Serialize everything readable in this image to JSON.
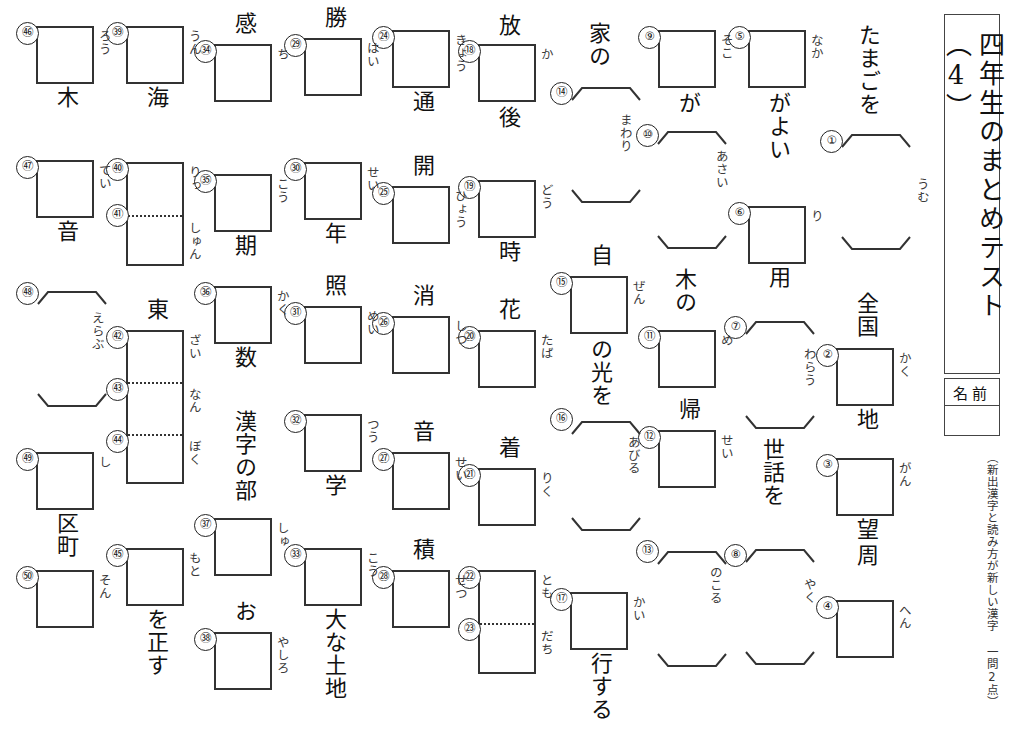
{
  "sheet": {
    "title": "四年生のまとめテスト（4）",
    "name_label": "名前",
    "note": "（新出漢字と読み方が新しい漢字 一問2点）"
  },
  "problems": [
    {
      "no": "①",
      "kind": "bracket",
      "lead": "たまごを",
      "trail": "",
      "reading": "うむ",
      "x": 838,
      "y": 20,
      "lead_x": 856,
      "lead_y": 24,
      "br_x": 840,
      "br_y": 133,
      "br_w": 72,
      "br_h": 118,
      "r_x": 915,
      "r_y": 178,
      "n_x": 820,
      "n_y": 130
    },
    {
      "no": "②",
      "kind": "box",
      "lead": "全国",
      "trail": "地",
      "reading": "かく",
      "x": 836,
      "y": 348,
      "w": 58,
      "h": 58,
      "lead_x": 854,
      "lead_y": 292,
      "trail_x": 854,
      "trail_y": 408,
      "r_x": 897,
      "r_y": 352,
      "n_x": 816,
      "n_y": 344
    },
    {
      "no": "③",
      "kind": "box",
      "lead": "",
      "trail": "望",
      "reading": "がん",
      "x": 836,
      "y": 458,
      "w": 58,
      "h": 58,
      "trail_x": 854,
      "trail_y": 518,
      "r_x": 897,
      "r_y": 462,
      "n_x": 816,
      "n_y": 454
    },
    {
      "no": "④",
      "kind": "box",
      "lead": "周",
      "trail": "",
      "reading": "へん",
      "x": 836,
      "y": 600,
      "w": 58,
      "h": 58,
      "lead_x": 854,
      "lead_y": 544,
      "r_x": 897,
      "r_y": 604,
      "n_x": 816,
      "n_y": 596
    },
    {
      "no": "⑤",
      "kind": "box",
      "lead": "",
      "trail": "がよい",
      "reading": "なか",
      "x": 748,
      "y": 30,
      "w": 58,
      "h": 58,
      "trail_x": 766,
      "trail_y": 92,
      "r_x": 809,
      "r_y": 34,
      "n_x": 728,
      "n_y": 26
    },
    {
      "no": "⑥",
      "kind": "box",
      "lead": "",
      "trail": "用",
      "reading": "り",
      "x": 748,
      "y": 206,
      "w": 58,
      "h": 58,
      "trail_x": 766,
      "trail_y": 266,
      "r_x": 809,
      "r_y": 210,
      "n_x": 728,
      "n_y": 202
    },
    {
      "no": "⑦",
      "kind": "bracket",
      "lead": "",
      "trail": "世話を",
      "reading": "わらう",
      "br_x": 744,
      "br_y": 320,
      "br_w": 72,
      "br_h": 110,
      "trail_x": 760,
      "trail_y": 438,
      "r_x": 802,
      "r_y": 348,
      "n_x": 724,
      "n_y": 316
    },
    {
      "no": "⑧",
      "kind": "bracket",
      "lead": "",
      "trail": "",
      "reading": "やく",
      "br_x": 744,
      "br_y": 548,
      "br_w": 72,
      "br_h": 118,
      "r_x": 802,
      "r_y": 578,
      "n_x": 724,
      "n_y": 544
    },
    {
      "no": "⑨",
      "kind": "box",
      "lead": "",
      "trail": "が",
      "reading": "そこ",
      "x": 658,
      "y": 30,
      "w": 58,
      "h": 58,
      "trail_x": 676,
      "trail_y": 92,
      "r_x": 719,
      "r_y": 34,
      "n_x": 638,
      "n_y": 26
    },
    {
      "no": "⑩",
      "kind": "bracket",
      "lead": "",
      "trail": "木の",
      "reading": "あさい",
      "br_x": 656,
      "br_y": 130,
      "br_w": 72,
      "br_h": 120,
      "trail_x": 672,
      "trail_y": 268,
      "r_x": 714,
      "r_y": 150,
      "n_x": 636,
      "n_y": 124
    },
    {
      "no": "⑪",
      "kind": "box",
      "lead": "",
      "trail": "",
      "reading": "め",
      "x": 658,
      "y": 330,
      "w": 58,
      "h": 58,
      "r_x": 719,
      "r_y": 334,
      "n_x": 638,
      "n_y": 326
    },
    {
      "no": "⑫",
      "kind": "box",
      "lead": "帰",
      "trail": "",
      "reading": "せい",
      "x": 658,
      "y": 430,
      "w": 58,
      "h": 58,
      "lead_x": 676,
      "lead_y": 398,
      "r_x": 719,
      "r_y": 434,
      "n_x": 638,
      "n_y": 426
    },
    {
      "no": "⑬",
      "kind": "bracket",
      "lead": "",
      "trail": "",
      "reading": "のこる",
      "br_x": 656,
      "br_y": 550,
      "br_w": 72,
      "br_h": 118,
      "r_x": 708,
      "r_y": 566,
      "n_x": 636,
      "n_y": 540
    },
    {
      "no": "⑭",
      "kind": "bracket",
      "lead": "家の",
      "trail": "",
      "reading": "まわり",
      "br_x": 570,
      "br_y": 86,
      "br_w": 72,
      "br_h": 118,
      "lead_x": 586,
      "lead_y": 22,
      "r_x": 618,
      "r_y": 114,
      "n_x": 550,
      "n_y": 82
    },
    {
      "no": "⑮",
      "kind": "box",
      "lead": "自",
      "trail": "の光を",
      "reading": "ぜん",
      "x": 570,
      "y": 276,
      "w": 58,
      "h": 58,
      "lead_x": 588,
      "lead_y": 244,
      "trail_x": 588,
      "trail_y": 338,
      "r_x": 631,
      "r_y": 280,
      "n_x": 550,
      "n_y": 272
    },
    {
      "no": "⑯",
      "kind": "bracket",
      "lead": "",
      "trail": "",
      "reading": "あびる",
      "br_x": 570,
      "br_y": 420,
      "br_w": 72,
      "br_h": 112,
      "r_x": 626,
      "r_y": 436,
      "n_x": 550,
      "n_y": 408
    },
    {
      "no": "⑰",
      "kind": "box",
      "lead": "",
      "trail": "行する",
      "reading": "かい",
      "x": 570,
      "y": 592,
      "w": 58,
      "h": 58,
      "trail_x": 588,
      "trail_y": 652,
      "r_x": 631,
      "r_y": 596,
      "n_x": 550,
      "n_y": 588
    },
    {
      "no": "⑱",
      "kind": "box",
      "lead": "放",
      "trail": "後",
      "reading": "か",
      "x": 478,
      "y": 44,
      "w": 58,
      "h": 58,
      "lead_x": 496,
      "lead_y": 14,
      "trail_x": 496,
      "trail_y": 106,
      "r_x": 539,
      "r_y": 48,
      "n_x": 458,
      "n_y": 40
    },
    {
      "no": "⑲",
      "kind": "box",
      "lead": "",
      "trail": "時",
      "reading": "どう",
      "x": 478,
      "y": 180,
      "w": 58,
      "h": 58,
      "trail_x": 496,
      "trail_y": 240,
      "r_x": 539,
      "r_y": 184,
      "n_x": 458,
      "n_y": 176
    },
    {
      "no": "⑳",
      "kind": "box",
      "lead": "花",
      "trail": "",
      "reading": "たば",
      "x": 478,
      "y": 330,
      "w": 58,
      "h": 58,
      "lead_x": 496,
      "lead_y": 298,
      "r_x": 539,
      "r_y": 334,
      "n_x": 458,
      "n_y": 326
    },
    {
      "no": "㉑",
      "kind": "box",
      "lead": "着",
      "trail": "",
      "reading": "りく",
      "x": 478,
      "y": 468,
      "w": 58,
      "h": 58,
      "lead_x": 496,
      "lead_y": 436,
      "r_x": 539,
      "r_y": 472,
      "n_x": 458,
      "n_y": 464
    },
    {
      "no": "㉒",
      "kind": "box2",
      "lead": "",
      "trail": "",
      "reading": "とも",
      "reading2": "だち",
      "x": 478,
      "y": 570,
      "w": 58,
      "h": 104,
      "r_x": 539,
      "r_y": 574,
      "r2_x": 539,
      "r2_y": 630,
      "n_x": 458,
      "n_y": 566,
      "n2": "㉓",
      "n2_x": 458,
      "n2_y": 618
    },
    {
      "no": "㉔",
      "kind": "box",
      "lead": "",
      "trail": "通",
      "reading": "きょう",
      "x": 392,
      "y": 30,
      "w": 58,
      "h": 58,
      "trail_x": 410,
      "trail_y": 90,
      "r_x": 453,
      "r_y": 34,
      "n_x": 372,
      "n_y": 26
    },
    {
      "no": "㉕",
      "kind": "box",
      "lead": "開",
      "trail": "",
      "reading": "ひょう",
      "x": 392,
      "y": 186,
      "w": 58,
      "h": 58,
      "lead_x": 410,
      "lead_y": 154,
      "r_x": 453,
      "r_y": 190,
      "n_x": 372,
      "n_y": 182
    },
    {
      "no": "㉖",
      "kind": "box",
      "lead": "消",
      "trail": "",
      "reading": "しつ",
      "x": 392,
      "y": 316,
      "w": 58,
      "h": 58,
      "lead_x": 410,
      "lead_y": 284,
      "r_x": 453,
      "r_y": 320,
      "n_x": 372,
      "n_y": 312
    },
    {
      "no": "㉗",
      "kind": "box",
      "lead": "音",
      "trail": "",
      "reading": "せい",
      "x": 392,
      "y": 452,
      "w": 58,
      "h": 58,
      "lead_x": 410,
      "lead_y": 420,
      "r_x": 453,
      "r_y": 456,
      "n_x": 372,
      "n_y": 448
    },
    {
      "no": "㉘",
      "kind": "box",
      "lead": "積",
      "trail": "",
      "reading": "せつ",
      "x": 392,
      "y": 570,
      "w": 58,
      "h": 58,
      "lead_x": 410,
      "lead_y": 538,
      "r_x": 453,
      "r_y": 574,
      "n_x": 372,
      "n_y": 566
    },
    {
      "no": "㉙",
      "kind": "box",
      "lead": "勝",
      "trail": "",
      "reading": "はい",
      "x": 304,
      "y": 38,
      "w": 58,
      "h": 58,
      "lead_x": 322,
      "lead_y": 6,
      "r_x": 365,
      "r_y": 42,
      "n_x": 284,
      "n_y": 34
    },
    {
      "no": "㉚",
      "kind": "box",
      "lead": "",
      "trail": "年",
      "reading": "せい",
      "x": 304,
      "y": 162,
      "w": 58,
      "h": 58,
      "trail_x": 322,
      "trail_y": 222,
      "r_x": 365,
      "r_y": 166,
      "n_x": 284,
      "n_y": 158
    },
    {
      "no": "㉛",
      "kind": "box",
      "lead": "照",
      "trail": "",
      "reading": "めい",
      "x": 304,
      "y": 306,
      "w": 58,
      "h": 58,
      "lead_x": 322,
      "lead_y": 274,
      "r_x": 365,
      "r_y": 310,
      "n_x": 284,
      "n_y": 302
    },
    {
      "no": "㉜",
      "kind": "box",
      "lead": "",
      "trail": "学",
      "reading": "つう",
      "x": 304,
      "y": 414,
      "w": 58,
      "h": 58,
      "trail_x": 322,
      "trail_y": 474,
      "r_x": 365,
      "r_y": 418,
      "n_x": 284,
      "n_y": 410
    },
    {
      "no": "㉝",
      "kind": "box",
      "lead": "",
      "trail": "大な土地",
      "reading": "こう",
      "x": 304,
      "y": 548,
      "w": 58,
      "h": 58,
      "trail_x": 322,
      "trail_y": 608,
      "r_x": 365,
      "r_y": 552,
      "n_x": 284,
      "n_y": 544
    },
    {
      "no": "㉞",
      "kind": "box",
      "lead": "感",
      "trail": "",
      "reading": "ち",
      "x": 214,
      "y": 44,
      "w": 58,
      "h": 58,
      "lead_x": 232,
      "lead_y": 12,
      "r_x": 275,
      "r_y": 48,
      "n_x": 194,
      "n_y": 40
    },
    {
      "no": "㉟",
      "kind": "box",
      "lead": "",
      "trail": "期",
      "reading": "こう",
      "x": 214,
      "y": 174,
      "w": 58,
      "h": 58,
      "trail_x": 232,
      "trail_y": 234,
      "r_x": 275,
      "r_y": 178,
      "n_x": 194,
      "n_y": 170
    },
    {
      "no": "㊱",
      "kind": "box",
      "lead": "",
      "trail": "数",
      "reading": "かく",
      "x": 214,
      "y": 286,
      "w": 58,
      "h": 58,
      "trail_x": 232,
      "trail_y": 346,
      "r_x": 275,
      "r_y": 290,
      "n_x": 194,
      "n_y": 282
    },
    {
      "no": "㊲",
      "kind": "box",
      "lead": "漢字の部",
      "trail": "",
      "reading": "しゅ",
      "x": 214,
      "y": 518,
      "w": 58,
      "h": 58,
      "lead_x": 232,
      "lead_y": 410,
      "r_x": 275,
      "r_y": 522,
      "n_x": 194,
      "n_y": 514
    },
    {
      "no": "㊳",
      "kind": "box",
      "lead": "お",
      "trail": "",
      "reading": "やしろ",
      "x": 214,
      "y": 632,
      "w": 58,
      "h": 58,
      "lead_x": 232,
      "lead_y": 600,
      "r_x": 275,
      "r_y": 636,
      "n_x": 194,
      "n_y": 628
    },
    {
      "no": "㊴",
      "kind": "box",
      "lead": "",
      "trail": "海",
      "reading": "うん",
      "x": 126,
      "y": 26,
      "w": 58,
      "h": 58,
      "trail_x": 144,
      "trail_y": 86,
      "r_x": 187,
      "r_y": 30,
      "n_x": 106,
      "n_y": 22
    },
    {
      "no": "㊵",
      "kind": "box2",
      "lead": "",
      "trail": "",
      "reading": "りっ",
      "reading2": "しゅん",
      "x": 126,
      "y": 162,
      "w": 58,
      "h": 104,
      "r_x": 187,
      "r_y": 166,
      "r2_x": 187,
      "r2_y": 222,
      "n_x": 106,
      "n_y": 158,
      "n2": "㊶",
      "n2_x": 106,
      "n2_y": 204
    },
    {
      "no": "㊷",
      "kind": "box3",
      "lead": "東",
      "trail": "",
      "reading": "ざい",
      "reading2": "なん",
      "reading3": "ぼく",
      "x": 126,
      "y": 330,
      "w": 58,
      "h": 154,
      "lead_x": 144,
      "lead_y": 298,
      "r_x": 187,
      "r_y": 334,
      "r2_x": 187,
      "r2_y": 388,
      "r3_x": 187,
      "r3_y": 440,
      "n_x": 106,
      "n_y": 326,
      "n2": "㊸",
      "n2_x": 106,
      "n2_y": 378,
      "n3": "㊹",
      "n3_x": 106,
      "n3_y": 430
    },
    {
      "no": "㊺",
      "kind": "box",
      "lead": "",
      "trail": "を正す",
      "reading": "もと",
      "x": 126,
      "y": 548,
      "w": 58,
      "h": 58,
      "trail_x": 144,
      "trail_y": 608,
      "r_x": 187,
      "r_y": 552,
      "n_x": 106,
      "n_y": 544
    },
    {
      "no": "㊻",
      "kind": "box",
      "lead": "",
      "trail": "木",
      "reading": "ろう",
      "x": 36,
      "y": 26,
      "w": 58,
      "h": 58,
      "trail_x": 54,
      "trail_y": 86,
      "r_x": 97,
      "r_y": 30,
      "n_x": 16,
      "n_y": 22
    },
    {
      "no": "㊼",
      "kind": "box",
      "lead": "",
      "trail": "音",
      "reading": "てい",
      "x": 36,
      "y": 160,
      "w": 58,
      "h": 58,
      "trail_x": 54,
      "trail_y": 220,
      "r_x": 97,
      "r_y": 164,
      "n_x": 16,
      "n_y": 156
    },
    {
      "no": "㊽",
      "kind": "bracket",
      "lead": "",
      "trail": "",
      "reading": "えらぶ",
      "br_x": 36,
      "br_y": 290,
      "br_w": 72,
      "br_h": 118,
      "r_x": 90,
      "r_y": 312,
      "n_x": 16,
      "n_y": 282
    },
    {
      "no": "㊾",
      "kind": "box",
      "lead": "",
      "trail": "区町",
      "reading": "し",
      "x": 36,
      "y": 452,
      "w": 58,
      "h": 58,
      "trail_x": 54,
      "trail_y": 512,
      "r_x": 97,
      "r_y": 456,
      "n_x": 16,
      "n_y": 448
    },
    {
      "no": "㊿",
      "kind": "box",
      "lead": "",
      "trail": "",
      "reading": "そん",
      "x": 36,
      "y": 570,
      "w": 58,
      "h": 58,
      "r_x": 97,
      "r_y": 574,
      "n_x": 16,
      "n_y": 566
    }
  ]
}
